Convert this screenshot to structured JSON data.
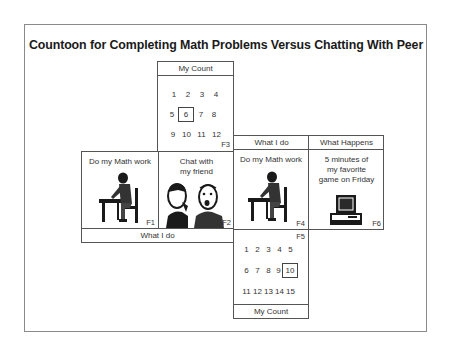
{
  "title": "Countoon for Completing Math Problems Versus Chatting With Peer",
  "top_count": {
    "header": "My Count",
    "rows": [
      [
        "1",
        "2",
        "3",
        "4"
      ],
      [
        "5",
        "6",
        "7",
        "8"
      ],
      [
        "9",
        "10",
        "11",
        "12"
      ]
    ],
    "boxed_value": "6",
    "frame_label": "F3"
  },
  "left_strip": {
    "cells": [
      {
        "label": "Do my Math work",
        "frame_label": "F1",
        "icon": "student-writing-at-desk-icon"
      },
      {
        "label_line1": "Chat with",
        "label_line2": "my friend",
        "frame_label": "F2",
        "icon": "two-people-chatting-icon"
      }
    ],
    "footer": "What I do"
  },
  "right_strip": {
    "headers": [
      "What I do",
      "What Happens"
    ],
    "cells": [
      {
        "label": "Do my Math work",
        "frame_label": "F4",
        "icon": "student-writing-at-desk-icon"
      },
      {
        "label_line1": "5 minutes of",
        "label_line2": "my favorite",
        "label_line3": "game on Friday",
        "frame_label": "F6",
        "icon": "computer-icon"
      }
    ]
  },
  "bottom_count": {
    "frame_label": "F5",
    "rows": [
      [
        "1",
        "2",
        "3",
        "4",
        "5"
      ],
      [
        "6",
        "7",
        "8",
        "9",
        "10"
      ],
      [
        "11",
        "12",
        "13",
        "14",
        "15"
      ]
    ],
    "boxed_value": "10",
    "footer": "My Count"
  }
}
